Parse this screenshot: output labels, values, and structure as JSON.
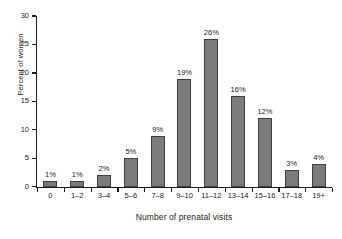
{
  "chart_data": {
    "type": "bar",
    "title": "",
    "xlabel": "Number of prenatal visits",
    "ylabel": "Percent of women",
    "categories": [
      "0",
      "1–2",
      "3–4",
      "5–6",
      "7–8",
      "9–10",
      "11–12",
      "13–14",
      "15–16",
      "17–18",
      "19+"
    ],
    "values": [
      1,
      1,
      2,
      5,
      9,
      19,
      26,
      16,
      12,
      3,
      4
    ],
    "value_labels": [
      "1%",
      "1%",
      "2%",
      "5%",
      "9%",
      "19%",
      "26%",
      "16%",
      "12%",
      "3%",
      "4%"
    ],
    "ylim": [
      0,
      30
    ],
    "yticks": [
      0,
      5,
      10,
      15,
      20,
      25,
      30
    ],
    "ytick_labels": [
      "0",
      "5",
      "10",
      "15",
      "20",
      "25",
      "30"
    ],
    "grid": false,
    "legend": false,
    "bar_color": "#7c7c7c",
    "bar_edge_color": "#3f3f3f",
    "axis_color": "#1a1a1a",
    "background_color": "#ffffff"
  }
}
